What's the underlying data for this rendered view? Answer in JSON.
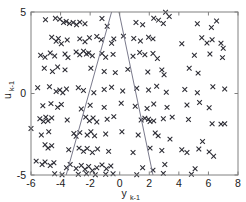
{
  "chart_data": {
    "type": "scatter",
    "title": "",
    "xlabel": "y_{k-1}",
    "ylabel": "u_{k-1}",
    "xlabel_base": "y",
    "xlabel_subscript": "k-1",
    "ylabel_base": "u",
    "ylabel_subscript": "k-1",
    "xlim": [
      -6,
      8
    ],
    "ylim": [
      -5,
      5
    ],
    "xticks": [
      -6,
      -4,
      -2,
      0,
      2,
      4,
      6,
      8
    ],
    "xticklabels": [
      "-6",
      "-4",
      "-2",
      "0",
      "2",
      "4",
      "6",
      "8"
    ],
    "yticks": [
      -5,
      0,
      5
    ],
    "yticklabels": [
      "-5",
      "0",
      "5"
    ],
    "grid": false,
    "legend": null,
    "marker": "x",
    "marker_color": "#2b2b33",
    "axis_color": "#808080",
    "line_color": "#7a7a8c",
    "annotation_lines": [
      {
        "name": "left-boundary",
        "x1": -0.55,
        "y1": 5.0,
        "x2": -3.62,
        "y2": -5.0
      },
      {
        "name": "right-boundary",
        "x1": -0.05,
        "y1": 5.0,
        "x2": 2.25,
        "y2": -5.0
      }
    ],
    "points": [
      [
        -5.02,
        4.52
      ],
      [
        -4.35,
        4.62
      ],
      [
        -4.05,
        4.55
      ],
      [
        -3.8,
        4.35
      ],
      [
        -3.62,
        4.42
      ],
      [
        -3.4,
        4.3
      ],
      [
        -3.15,
        4.35
      ],
      [
        -2.92,
        4.22
      ],
      [
        -2.7,
        4.38
      ],
      [
        -2.35,
        4.28
      ],
      [
        -1.2,
        4.6
      ],
      [
        -0.85,
        4.12
      ],
      [
        1.1,
        4.35
      ],
      [
        1.55,
        4.22
      ],
      [
        2.3,
        4.62
      ],
      [
        2.62,
        4.5
      ],
      [
        2.95,
        4.3
      ],
      [
        3.35,
        4.72
      ],
      [
        3.1,
        4.98
      ],
      [
        5.25,
        4.28
      ],
      [
        6.2,
        4.05
      ],
      [
        6.55,
        4.45
      ],
      [
        -4.6,
        3.45
      ],
      [
        -4.3,
        3.2
      ],
      [
        -4.15,
        3.38
      ],
      [
        -3.95,
        3.05
      ],
      [
        -3.55,
        3.28
      ],
      [
        -2.7,
        3.35
      ],
      [
        -2.35,
        3.18
      ],
      [
        -2.05,
        3.42
      ],
      [
        -1.55,
        3.5
      ],
      [
        -1.25,
        3.3
      ],
      [
        -0.4,
        3.35
      ],
      [
        -0.55,
        3.08
      ],
      [
        0.25,
        3.52
      ],
      [
        0.95,
        3.38
      ],
      [
        1.4,
        3.22
      ],
      [
        1.95,
        3.45
      ],
      [
        2.25,
        3.35
      ],
      [
        4.2,
        3.05
      ],
      [
        5.55,
        3.42
      ],
      [
        5.9,
        3.1
      ],
      [
        6.25,
        3.3
      ],
      [
        6.85,
        3.08
      ],
      [
        7.0,
        2.78
      ],
      [
        -5.35,
        2.35
      ],
      [
        -5.05,
        2.22
      ],
      [
        -4.7,
        2.48
      ],
      [
        -4.4,
        2.3
      ],
      [
        -3.7,
        2.42
      ],
      [
        -3.5,
        2.2
      ],
      [
        -2.95,
        2.55
      ],
      [
        -2.7,
        2.38
      ],
      [
        -2.45,
        2.6
      ],
      [
        -2.25,
        2.42
      ],
      [
        -2.1,
        2.48
      ],
      [
        -1.85,
        2.32
      ],
      [
        -1.2,
        2.45
      ],
      [
        -0.95,
        2.22
      ],
      [
        -0.45,
        2.4
      ],
      [
        0.9,
        2.28
      ],
      [
        1.35,
        2.52
      ],
      [
        1.7,
        2.38
      ],
      [
        2.25,
        2.45
      ],
      [
        2.55,
        2.15
      ],
      [
        5.05,
        2.35
      ],
      [
        6.1,
        2.42
      ],
      [
        6.95,
        2.2
      ],
      [
        -5.1,
        1.55
      ],
      [
        -4.55,
        1.35
      ],
      [
        -4.2,
        1.62
      ],
      [
        -3.7,
        1.45
      ],
      [
        -1.95,
        1.55
      ],
      [
        -1.05,
        1.35
      ],
      [
        -0.3,
        1.28
      ],
      [
        0.55,
        1.48
      ],
      [
        1.9,
        1.32
      ],
      [
        2.85,
        1.45
      ],
      [
        3.0,
        1.15
      ],
      [
        4.7,
        1.55
      ],
      [
        5.3,
        1.25
      ],
      [
        -5.55,
        0.35
      ],
      [
        -4.75,
        0.42
      ],
      [
        -4.3,
        0.12
      ],
      [
        -4.05,
        0.22
      ],
      [
        -3.85,
        0.05
      ],
      [
        -3.6,
        0.28
      ],
      [
        -2.8,
        0.35
      ],
      [
        -2.45,
        0.18
      ],
      [
        -1.75,
        0.05
      ],
      [
        -1.05,
        0.25
      ],
      [
        -0.55,
        0.38
      ],
      [
        0.2,
        0.15
      ],
      [
        1.15,
        0.32
      ],
      [
        1.95,
        0.22
      ],
      [
        2.5,
        0.45
      ],
      [
        3.15,
        0.08
      ],
      [
        4.4,
        0.25
      ],
      [
        5.25,
        0.05
      ],
      [
        6.3,
        0.42
      ],
      [
        7.1,
        0.28
      ],
      [
        -5.2,
        -0.75
      ],
      [
        -4.65,
        -0.62
      ],
      [
        -4.2,
        -0.85
      ],
      [
        -3.95,
        -0.68
      ],
      [
        -2.6,
        -0.95
      ],
      [
        -2.0,
        -0.72
      ],
      [
        -1.05,
        -0.85
      ],
      [
        0.1,
        -0.6
      ],
      [
        1.05,
        -0.78
      ],
      [
        1.85,
        -0.92
      ],
      [
        2.3,
        -0.65
      ],
      [
        3.2,
        -0.85
      ],
      [
        4.55,
        -0.7
      ],
      [
        5.4,
        -0.55
      ],
      [
        6.05,
        -0.88
      ],
      [
        -5.4,
        -1.55
      ],
      [
        -5.15,
        -1.72
      ],
      [
        -5.0,
        -1.45
      ],
      [
        -4.85,
        -1.68
      ],
      [
        -4.6,
        -1.5
      ],
      [
        -3.55,
        -1.62
      ],
      [
        -2.3,
        -1.45
      ],
      [
        -2.05,
        -1.68
      ],
      [
        -1.8,
        -1.5
      ],
      [
        -1.55,
        -1.75
      ],
      [
        -0.85,
        -1.58
      ],
      [
        -0.4,
        -1.42
      ],
      [
        1.45,
        -1.62
      ],
      [
        1.7,
        -1.52
      ],
      [
        1.95,
        -1.58
      ],
      [
        2.05,
        -1.72
      ],
      [
        2.3,
        -1.68
      ],
      [
        2.95,
        -1.55
      ],
      [
        3.55,
        -1.45
      ],
      [
        4.65,
        -1.6
      ],
      [
        6.25,
        -1.85
      ],
      [
        6.85,
        -1.88
      ],
      [
        7.1,
        -1.85
      ],
      [
        -6.0,
        -2.15
      ],
      [
        -5.3,
        -2.55
      ],
      [
        -4.8,
        -2.35
      ],
      [
        -3.1,
        -2.45
      ],
      [
        -2.95,
        -2.62
      ],
      [
        -2.7,
        -2.4
      ],
      [
        -2.2,
        -2.55
      ],
      [
        -1.95,
        -2.35
      ],
      [
        -1.7,
        -2.6
      ],
      [
        -0.95,
        -2.48
      ],
      [
        0.15,
        -2.35
      ],
      [
        1.25,
        -2.55
      ],
      [
        2.4,
        -2.42
      ],
      [
        2.6,
        -2.6
      ],
      [
        3.4,
        -2.8
      ],
      [
        5.6,
        -2.95
      ],
      [
        -5.05,
        -3.15
      ],
      [
        -4.85,
        -3.35
      ],
      [
        -4.6,
        -3.2
      ],
      [
        -3.45,
        -3.45
      ],
      [
        -2.75,
        -3.35
      ],
      [
        -2.45,
        -3.55
      ],
      [
        -2.2,
        -3.38
      ],
      [
        -1.85,
        -3.62
      ],
      [
        -1.5,
        -3.4
      ],
      [
        -0.75,
        -3.55
      ],
      [
        0.9,
        -3.62
      ],
      [
        2.05,
        -3.35
      ],
      [
        2.85,
        -3.5
      ],
      [
        4.2,
        -3.45
      ],
      [
        4.55,
        -3.62
      ],
      [
        5.35,
        -3.4
      ],
      [
        6.05,
        -3.58
      ],
      [
        6.35,
        -3.85
      ],
      [
        -5.65,
        -4.15
      ],
      [
        -5.25,
        -4.35
      ],
      [
        -5.05,
        -4.2
      ],
      [
        -4.7,
        -4.42
      ],
      [
        -4.45,
        -4.25
      ],
      [
        -3.6,
        -4.55
      ],
      [
        -3.35,
        -4.35
      ],
      [
        -2.95,
        -4.6
      ],
      [
        -2.6,
        -4.42
      ],
      [
        -2.35,
        -4.65
      ],
      [
        -2.1,
        -4.48
      ],
      [
        -1.85,
        -4.72
      ],
      [
        -1.55,
        -4.55
      ],
      [
        -1.2,
        -4.38
      ],
      [
        -0.9,
        -4.62
      ],
      [
        -0.6,
        -4.45
      ],
      [
        1.55,
        -4.55
      ],
      [
        2.25,
        -4.7
      ],
      [
        3.05,
        -4.35
      ],
      [
        5.1,
        -4.62
      ],
      [
        -4.4,
        -4.92
      ],
      [
        -3.9,
        -4.98
      ],
      [
        -2.8,
        -4.95
      ],
      [
        -2.25,
        -4.92
      ],
      [
        -1.65,
        -4.98
      ],
      [
        -0.95,
        -4.95
      ],
      [
        -0.45,
        -4.92
      ],
      [
        1.15,
        -4.98
      ],
      [
        2.95,
        -4.9
      ],
      [
        4.85,
        -4.95
      ]
    ]
  }
}
